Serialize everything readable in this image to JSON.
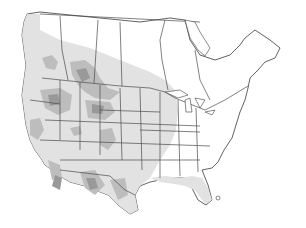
{
  "map": {
    "title": "",
    "region": "North America",
    "legend": [],
    "shading": {
      "background": "#ffffff",
      "light_range": "#e4e4e4",
      "medium_range": "#bdbdbd",
      "dark_range": "#999999",
      "outline": "#3a3a3a"
    }
  }
}
